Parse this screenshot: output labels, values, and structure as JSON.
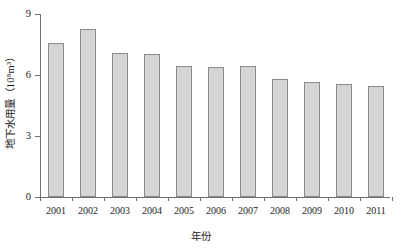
{
  "chart_data": {
    "type": "bar",
    "title": "",
    "subtitle": "",
    "xlabel": "年份",
    "ylabel": "地下水用量（10⁸m³）",
    "categories": [
      "2001",
      "2002",
      "2003",
      "2004",
      "2005",
      "2006",
      "2007",
      "2008",
      "2009",
      "2010",
      "2011"
    ],
    "values": [
      7.57,
      8.25,
      7.07,
      7.05,
      6.45,
      6.4,
      6.45,
      5.8,
      5.66,
      5.56,
      5.46
    ],
    "ylim": [
      0,
      9
    ],
    "yticks": [
      "0",
      "3",
      "6",
      "9"
    ],
    "ytick_values": [
      0,
      3,
      6,
      9
    ],
    "grid": false,
    "legend": null,
    "legend_position": "none",
    "series": [
      {
        "name": "地下水用量",
        "values": [
          7.57,
          8.25,
          7.07,
          7.05,
          6.45,
          6.4,
          6.45,
          5.8,
          5.66,
          5.56,
          5.46
        ]
      }
    ],
    "colors": {
      "bar_fill": "#d4d4d4",
      "bar_border": "#8a8a8a",
      "axis": "#6f6f6f",
      "text": "#1c1c1c",
      "background": "#ffffff"
    }
  }
}
